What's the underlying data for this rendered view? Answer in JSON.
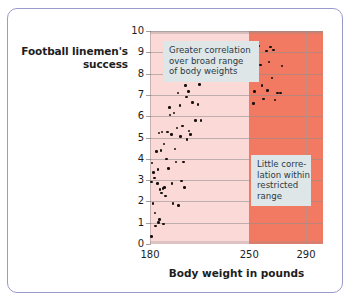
{
  "figure": {
    "frame_border_color": "#9a9acb",
    "background": "#ffffff"
  },
  "chart_data": {
    "type": "scatter",
    "title": "",
    "xlabel": "Body weight in pounds",
    "ylabel": "Football linemen's success",
    "ylabel_lines": [
      "Football linemen's",
      "success"
    ],
    "xlim": [
      180,
      302
    ],
    "ylim": [
      0,
      10
    ],
    "xticks": [
      180,
      250,
      290
    ],
    "xticklabels": [
      "180",
      "250",
      "290"
    ],
    "yticks": [
      0,
      1,
      2,
      3,
      4,
      5,
      6,
      7,
      8,
      9,
      10
    ],
    "yticklabels": [
      "0",
      "1",
      "2",
      "3",
      "4",
      "5",
      "6",
      "7",
      "8",
      "9",
      "10"
    ],
    "grid": "horizontal-and-vertical",
    "legend": "none",
    "regions": [
      {
        "name": "broad-range-band",
        "x_start": 180,
        "x_end": 250,
        "color": "#fad9d7",
        "label": "Greater correlation over broad range of body weights"
      },
      {
        "name": "restricted-range-band",
        "x_start": 250,
        "x_end": 302,
        "color": "#f27a62",
        "label": "Little correlation within restricted range"
      }
    ],
    "annotations": [
      {
        "name": "broad-range-note",
        "lines": [
          "Greater correlation",
          "over broad range",
          "of body weights"
        ],
        "background": "#dfe6e8",
        "text_color": "#2b3a44"
      },
      {
        "name": "restricted-range-note",
        "lines": [
          "Little corre-",
          "lation within",
          "restricted",
          "range"
        ],
        "background": "#dfe6e8",
        "text_color": "#2b3a44"
      }
    ],
    "point_color": "#15100e",
    "points": [
      [
        181.0,
        0.35
      ],
      [
        181.2,
        2.9
      ],
      [
        181.5,
        3.8
      ],
      [
        182.0,
        1.9
      ],
      [
        182.6,
        3.35
      ],
      [
        183.0,
        3.1
      ],
      [
        183.4,
        1.45
      ],
      [
        184.0,
        0.85
      ],
      [
        184.6,
        4.35
      ],
      [
        185.2,
        2.85
      ],
      [
        185.5,
        3.5
      ],
      [
        186.0,
        1.0
      ],
      [
        186.4,
        5.2
      ],
      [
        186.8,
        1.15
      ],
      [
        187.2,
        2.55
      ],
      [
        187.6,
        4.4
      ],
      [
        188.0,
        2.4
      ],
      [
        188.6,
        5.25
      ],
      [
        189.0,
        2.6
      ],
      [
        189.4,
        0.95
      ],
      [
        189.8,
        4.7
      ],
      [
        190.4,
        2.65
      ],
      [
        191.0,
        2.25
      ],
      [
        191.6,
        4.0
      ],
      [
        192.2,
        5.25
      ],
      [
        193.0,
        3.55
      ],
      [
        193.6,
        6.4
      ],
      [
        194.2,
        6.05
      ],
      [
        195.0,
        5.15
      ],
      [
        195.6,
        2.85
      ],
      [
        196.2,
        1.9
      ],
      [
        197.0,
        6.15
      ],
      [
        197.6,
        4.45
      ],
      [
        198.2,
        3.85
      ],
      [
        199.0,
        5.45
      ],
      [
        199.6,
        7.1
      ],
      [
        200.2,
        1.8
      ],
      [
        201.0,
        6.5
      ],
      [
        201.6,
        5.05
      ],
      [
        202.2,
        2.95
      ],
      [
        203.0,
        5.55
      ],
      [
        203.6,
        3.85
      ],
      [
        204.2,
        2.65
      ],
      [
        205.0,
        7.45
      ],
      [
        205.6,
        6.9
      ],
      [
        206.2,
        4.9
      ],
      [
        207.0,
        7.15
      ],
      [
        207.6,
        5.3
      ],
      [
        208.4,
        5.15
      ],
      [
        209.0,
        7.85
      ],
      [
        210.0,
        6.65
      ],
      [
        211.0,
        7.95
      ],
      [
        212.0,
        5.8
      ],
      [
        213.0,
        8.05
      ],
      [
        214.0,
        6.55
      ],
      [
        215.0,
        7.5
      ],
      [
        216.0,
        5.8
      ],
      [
        251.0,
        8.95
      ],
      [
        252.0,
        7.75
      ],
      [
        253.0,
        6.6
      ],
      [
        253.8,
        7.15
      ],
      [
        255.0,
        8.55
      ],
      [
        256.0,
        8.85
      ],
      [
        257.0,
        9.3
      ],
      [
        258.0,
        8.4
      ],
      [
        259.0,
        7.45
      ],
      [
        260.0,
        6.8
      ],
      [
        262.0,
        9.05
      ],
      [
        263.0,
        7.2
      ],
      [
        264.0,
        8.55
      ],
      [
        265.0,
        9.25
      ],
      [
        266.0,
        7.8
      ],
      [
        267.0,
        9.1
      ],
      [
        268.0,
        6.75
      ],
      [
        270.0,
        7.1
      ],
      [
        272.0,
        7.1
      ],
      [
        273.0,
        8.35
      ]
    ]
  }
}
